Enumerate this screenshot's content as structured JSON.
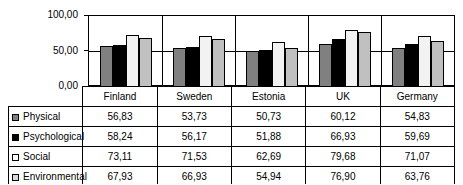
{
  "chart_data": {
    "type": "bar",
    "title": "",
    "xlabel": "",
    "ylabel": "",
    "ylim": [
      0,
      100
    ],
    "yticks": [
      "0,00",
      "50,00",
      "100,00"
    ],
    "ytick_values": [
      0,
      50,
      100
    ],
    "grid": true,
    "legend_position": "table-left",
    "decimal_separator": ",",
    "categories": [
      "Finland",
      "Sweden",
      "Estonia",
      "UK",
      "Germany"
    ],
    "series": [
      {
        "name": "Physical",
        "color": "#808080",
        "values": [
          56.83,
          53.73,
          50.73,
          60.12,
          54.83
        ],
        "labels": [
          "56,83",
          "53,73",
          "50,73",
          "60,12",
          "54,83"
        ]
      },
      {
        "name": "Psychological",
        "color": "#000000",
        "values": [
          58.24,
          56.17,
          51.88,
          66.93,
          59.69
        ],
        "labels": [
          "58,24",
          "56,17",
          "51,88",
          "66,93",
          "59,69"
        ]
      },
      {
        "name": "Social",
        "color": "#ffffff",
        "values": [
          73.11,
          71.53,
          62.69,
          79.68,
          71.07
        ],
        "labels": [
          "73,11",
          "71,53",
          "62,69",
          "79,68",
          "71,07"
        ]
      },
      {
        "name": "Environmental",
        "color": "#d9d9d9",
        "values": [
          67.93,
          66.93,
          54.94,
          76.9,
          63.76
        ],
        "labels": [
          "67,93",
          "66,93",
          "54,94",
          "76,90",
          "63,76"
        ]
      }
    ]
  }
}
